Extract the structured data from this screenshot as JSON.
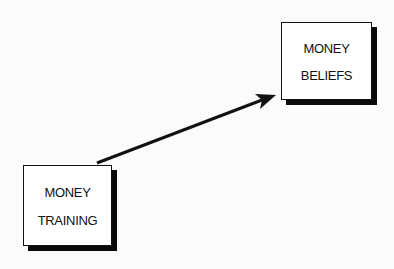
{
  "diagram": {
    "nodes": [
      {
        "id": "money-training",
        "lines": [
          "MONEY",
          "TRAINING"
        ]
      },
      {
        "id": "money-beliefs",
        "lines": [
          "MONEY",
          "BELIEFS"
        ]
      }
    ],
    "edges": [
      {
        "from": "money-training",
        "to": "money-beliefs",
        "type": "arrow"
      }
    ],
    "colors": {
      "line": "#111111",
      "background": "#fbfbfb",
      "box_fill": "#ffffff"
    }
  }
}
